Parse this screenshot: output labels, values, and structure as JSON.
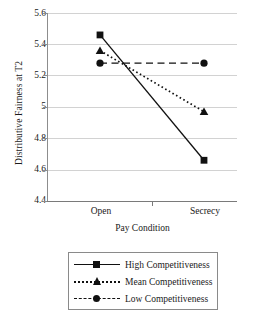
{
  "chart_data": {
    "type": "line",
    "title": "",
    "xlabel": "Pay Condition",
    "ylabel": "Distributive Fairness at T2",
    "categories": [
      "Open",
      "Secrecy"
    ],
    "ylim": [
      4.4,
      5.6
    ],
    "yticks": [
      "5.6",
      "5.4",
      "5.2",
      "5",
      "4.8",
      "4.6",
      "4.4"
    ],
    "ytick_values": [
      5.6,
      5.4,
      5.2,
      5.0,
      4.8,
      4.6,
      4.4
    ],
    "grid": true,
    "legend_position": "bottom",
    "series": [
      {
        "name": "High Competitiveness",
        "values": [
          5.46,
          4.66
        ],
        "marker": "square",
        "linestyle": "solid",
        "color": "#111111"
      },
      {
        "name": "Mean Competitiveness",
        "values": [
          5.36,
          4.97
        ],
        "marker": "triangle",
        "linestyle": "dotted",
        "color": "#111111"
      },
      {
        "name": "Low Competitiveness",
        "values": [
          5.28,
          5.28
        ],
        "marker": "circle",
        "linestyle": "dashed",
        "color": "#111111"
      }
    ]
  },
  "legend": {
    "items": [
      {
        "label": "High Competitiveness"
      },
      {
        "label": "Mean Competitiveness"
      },
      {
        "label": "Low Competitiveness"
      }
    ]
  },
  "colors": {
    "line": "#111111",
    "grid": "#d2d2d2",
    "axis": "#8a8a8a"
  }
}
